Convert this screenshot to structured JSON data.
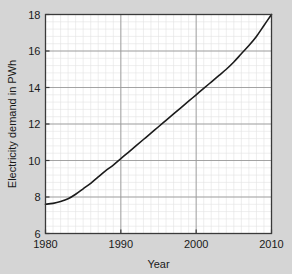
{
  "figure": {
    "background_color": "#d5d5d5",
    "plot_background_color": "#ffffff",
    "axis_color": "#3a3a3a",
    "major_grid_color": "#9a9a9a",
    "minor_grid_color": "#e2e2e2",
    "line_color": "#1b1b1b"
  },
  "chart_data": {
    "type": "line",
    "title": "",
    "xlabel": "Year",
    "ylabel": "Electricity demand in PWh",
    "xlim": [
      1980,
      2010
    ],
    "ylim": [
      6,
      18
    ],
    "xticks": [
      1980,
      1990,
      2000,
      2010
    ],
    "yticks": [
      6,
      8,
      10,
      12,
      14,
      16,
      18
    ],
    "xtick_labels": [
      "1980",
      "1990",
      "2000",
      "2010"
    ],
    "ytick_labels": [
      "6",
      "8",
      "10",
      "12",
      "14",
      "16",
      "18"
    ],
    "grid": true,
    "minor_grid": true,
    "minor_grid_x_step": 1,
    "minor_grid_y_step": 0.4,
    "legend": null,
    "series": [
      {
        "name": "Electricity demand",
        "x": [
          1980,
          1981,
          1982,
          1983,
          1984,
          1985,
          1986,
          1987,
          1988,
          1989,
          1990,
          1991,
          1992,
          1993,
          1994,
          1995,
          1996,
          1997,
          1998,
          1999,
          2000,
          2001,
          2002,
          2003,
          2004,
          2005,
          2006,
          2007,
          2008,
          2009,
          2010
        ],
        "values": [
          7.6,
          7.65,
          7.75,
          7.9,
          8.15,
          8.45,
          8.75,
          9.1,
          9.45,
          9.75,
          10.1,
          10.45,
          10.8,
          11.15,
          11.5,
          11.85,
          12.2,
          12.55,
          12.9,
          13.25,
          13.6,
          13.95,
          14.3,
          14.65,
          15.0,
          15.4,
          15.85,
          16.3,
          16.8,
          17.4,
          18.0
        ]
      }
    ]
  }
}
